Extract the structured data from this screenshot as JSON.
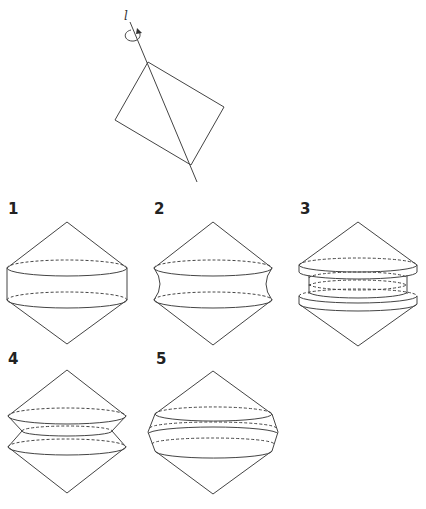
{
  "figure": {
    "axis_label": "l",
    "rotation_arrow": "rotation-arrow-icon"
  },
  "options": [
    {
      "label": "1",
      "description": "Two cones joined by a cylinder"
    },
    {
      "label": "2",
      "description": "Two cones joined by a concave (hyperboloid-like) waist"
    },
    {
      "label": "3",
      "description": "Two cones with stacked discs between them"
    },
    {
      "label": "4",
      "description": "Two double-cones stacked, pinched at the middle"
    },
    {
      "label": "5",
      "description": "Two cones with a convex banded middle"
    }
  ],
  "colors": {
    "stroke": "#444444",
    "background": "#ffffff"
  }
}
